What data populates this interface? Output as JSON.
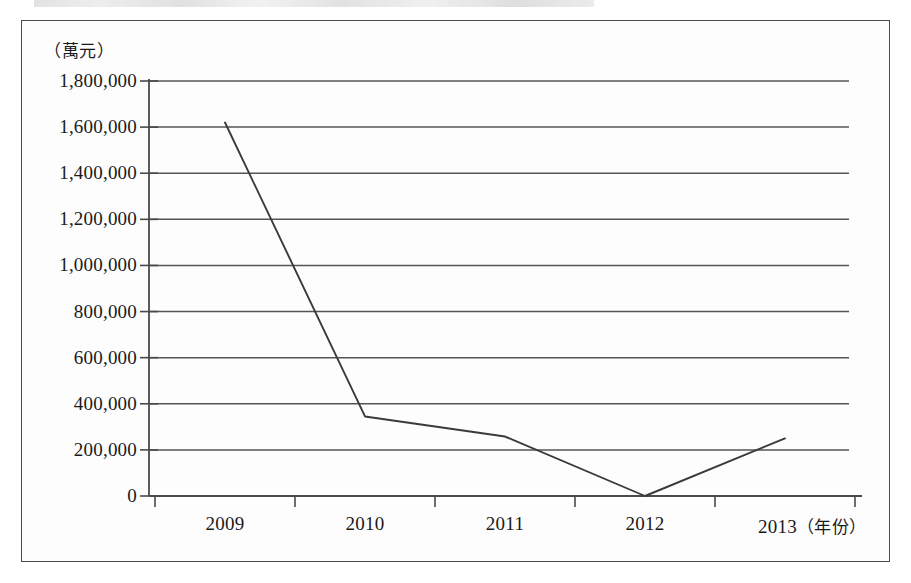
{
  "page": {
    "background_color": "#ffffff",
    "scan_artifact": "partial-cropped-text-line"
  },
  "chart_data": {
    "type": "line",
    "title": "",
    "subtitle": "",
    "xlabel": "（年份）",
    "ylabel": "（萬元）",
    "x": [
      "2009",
      "2010",
      "2011",
      "2012",
      "2013"
    ],
    "categories": [
      "2009",
      "2010",
      "2011",
      "2012",
      "2013"
    ],
    "values": [
      1620000,
      345000,
      258000,
      0,
      250000
    ],
    "series": [
      {
        "name": "",
        "values": [
          1620000,
          345000,
          258000,
          0,
          250000
        ]
      }
    ],
    "ylim": [
      0,
      1800000
    ],
    "ytick_step": 200000,
    "ytick_labels": [
      "1,800,000",
      "1,600,000",
      "1,400,000",
      "1,200,000",
      "1,000,000",
      "800,000",
      "600,000",
      "400,000",
      "200,000",
      "0"
    ],
    "ytick_values": [
      1800000,
      1600000,
      1400000,
      1200000,
      1000000,
      800000,
      600000,
      400000,
      200000,
      0
    ],
    "xtick_labels": [
      "2009",
      "2010",
      "2011",
      "2012",
      "2013"
    ],
    "grid": true,
    "grid_orientation": "horizontal",
    "legend": false,
    "legend_position": "none",
    "line_color": "#3a3a3a",
    "axis_color": "#4a4a4a",
    "grid_color": "#555555",
    "border_color": "#4a4a4a",
    "markers": false,
    "annotations": []
  },
  "axis_labels": {
    "y_unit": "（萬元）",
    "x_unit": "（年份）"
  },
  "x_axis_series_labels": [
    {
      "label": "2009",
      "unit": ""
    },
    {
      "label": "2010",
      "unit": ""
    },
    {
      "label": "2011",
      "unit": ""
    },
    {
      "label": "2012",
      "unit": ""
    },
    {
      "label": "2013",
      "unit": "（年份）"
    }
  ]
}
